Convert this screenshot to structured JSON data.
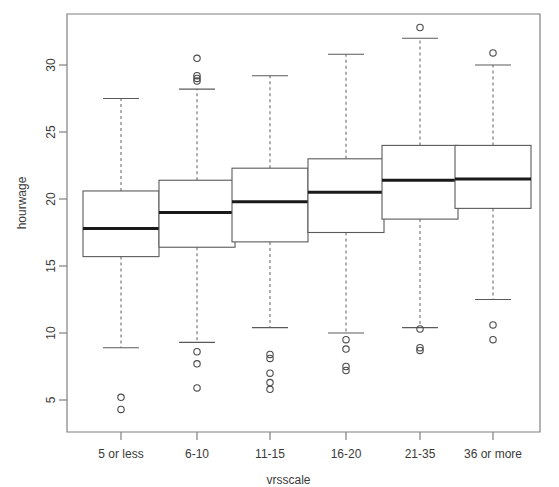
{
  "chart_data": {
    "type": "box",
    "title": "",
    "xlabel": "vrsscale",
    "ylabel": "hourwage",
    "categories": [
      "5 or less",
      "6-10",
      "11-15",
      "16-20",
      "21-35",
      "36 or more"
    ],
    "ytick_labels": [
      "5",
      "10",
      "15",
      "20",
      "25",
      "30"
    ],
    "ytick_values": [
      5,
      10,
      15,
      20,
      25,
      30
    ],
    "ylim": [
      3.5,
      33.8
    ],
    "grid": false,
    "legend": "none",
    "boxes": [
      {
        "category": "5 or less",
        "whisker_low": 8.9,
        "q1": 15.7,
        "median": 17.8,
        "q3": 20.6,
        "whisker_high": 27.5,
        "outliers": [
          5.2,
          4.3
        ]
      },
      {
        "category": "6-10",
        "whisker_low": 9.3,
        "q1": 16.4,
        "median": 19.0,
        "q3": 21.4,
        "whisker_high": 28.2,
        "outliers": [
          30.5,
          29.2,
          29.0,
          28.8,
          8.6,
          7.7,
          5.9
        ]
      },
      {
        "category": "11-15",
        "whisker_low": 10.4,
        "q1": 16.8,
        "median": 19.8,
        "q3": 22.3,
        "whisker_high": 29.2,
        "outliers": [
          8.4,
          8.1,
          7.0,
          6.3,
          5.8
        ]
      },
      {
        "category": "16-20",
        "whisker_low": 10.0,
        "q1": 17.5,
        "median": 20.5,
        "q3": 23.0,
        "whisker_high": 30.8,
        "outliers": [
          9.5,
          8.8,
          7.5,
          7.2
        ]
      },
      {
        "category": "21-35",
        "whisker_low": 10.4,
        "q1": 18.5,
        "median": 21.4,
        "q3": 24.0,
        "whisker_high": 32.0,
        "outliers": [
          32.8,
          10.3,
          8.9,
          8.7
        ]
      },
      {
        "category": "36 or more",
        "whisker_low": 12.5,
        "q1": 19.3,
        "median": 21.5,
        "q3": 24.0,
        "whisker_high": 30.0,
        "outliers": [
          30.9,
          10.6,
          9.5
        ]
      }
    ],
    "colors": {
      "box_stroke": "#5a5a5a",
      "median_stroke": "#1a1a1a",
      "whisker_stroke": "#6e6e6e",
      "axis": "#808080",
      "text": "#3a3a3a",
      "background": "#ffffff"
    }
  }
}
